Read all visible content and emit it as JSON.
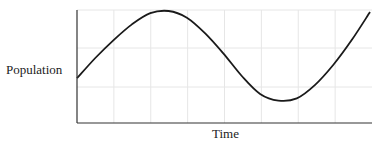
{
  "chart_data": {
    "type": "line",
    "title": "",
    "xlabel": "Time",
    "ylabel": "Population",
    "grid": true,
    "legend": null,
    "series": [
      {
        "name": "Population",
        "x": [
          0,
          0.5,
          1,
          1.5,
          2,
          2.5,
          3,
          3.5,
          4,
          4.5,
          5,
          5.5,
          6,
          6.5,
          7,
          7.5,
          8
        ],
        "values": [
          0.4,
          0.58,
          0.74,
          0.88,
          0.98,
          1.0,
          0.94,
          0.8,
          0.62,
          0.42,
          0.26,
          0.2,
          0.22,
          0.34,
          0.52,
          0.74,
          0.99
        ]
      }
    ],
    "xlim": [
      0,
      8
    ],
    "ylim": [
      0,
      1
    ]
  },
  "labels": {
    "x_axis": "Time",
    "y_axis": "Population"
  },
  "colors": {
    "curve": "#1a1a1a",
    "axis": "#333333",
    "grid": "#e6e6e6"
  }
}
